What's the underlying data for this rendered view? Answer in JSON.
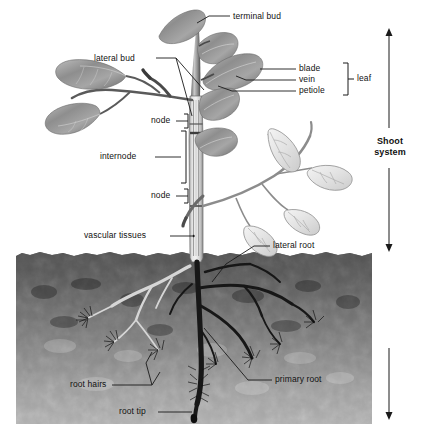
{
  "diagram": {
    "background_color": "#ffffff"
  },
  "labels": {
    "terminal_bud": "terminal bud",
    "lateral_bud": "lateral bud",
    "blade": "blade",
    "vein": "vein",
    "petiole": "petiole",
    "leaf": "leaf",
    "node_upper": "node",
    "internode": "internode",
    "node_lower": "node",
    "vascular_tissues": "vascular tissues",
    "lateral_root": "lateral root",
    "root_hairs": "root hairs",
    "primary_root": "primary root",
    "root_tip": "root tip",
    "shoot_system_line1": "Shoot",
    "shoot_system_line2": "system",
    "root_system_line1": "Root",
    "root_system_line2": "system"
  },
  "colors": {
    "leader_line": "#1a1a1a",
    "label_text": "#111111",
    "root_system_text": "#ffffff",
    "soil_dark": "#1c1c1c",
    "soil_mid": "#6e6e6e",
    "soil_light": "#cfcfcf",
    "stem_light": "#d9d9d9",
    "stem_outline": "#4a4a4a",
    "leaf_dark": "#8a8a8a",
    "leaf_light": "#e8e8e8",
    "root_dark": "#151515",
    "root_light": "#d2d2d2"
  },
  "regions": {
    "soil_top_y": 252,
    "soil_bottom_y": 424,
    "soil_left_x": 16,
    "soil_right_x": 372
  }
}
